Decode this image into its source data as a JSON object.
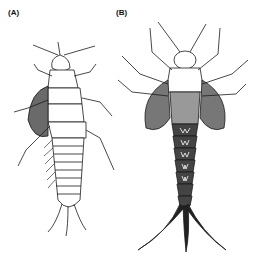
{
  "figure": {
    "panels": [
      {
        "label": "(A)",
        "subject": "stonefly nymph illustration",
        "x": 8,
        "y": 8
      },
      {
        "label": "(B)",
        "subject": "mayfly nymph illustration",
        "x": 116,
        "y": 8
      }
    ],
    "colors": {
      "ink": "#1a1a1a",
      "shade": "#555555",
      "background": "#ffffff"
    }
  }
}
